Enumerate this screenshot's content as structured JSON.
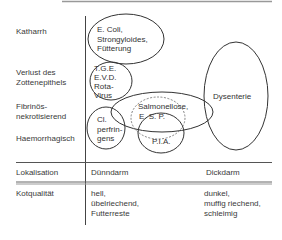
{
  "rows": {
    "katarrh": "Katharrh",
    "verlust_line1": "Verlust des",
    "verlust_line2": "Zottenepithels",
    "fibrin_line1": "Fibrinös-",
    "fibrin_line2": "nekrotisierend",
    "haemorrhagisch": "Haemorrhagisch"
  },
  "diseases": {
    "ecoli": [
      "E. Coli,",
      "Strongyloides,",
      "Fütterung"
    ],
    "tge": [
      "T.G.E.",
      "E.V.D.",
      "Rota-",
      "Virus"
    ],
    "dysenterie": "Dysenterie",
    "salmonellose": [
      "Salmonellose,",
      "E. S. P."
    ],
    "clperfringens": [
      "Cl.",
      "perfrin-",
      "gens"
    ],
    "pia": "P.I.A."
  },
  "table": {
    "lokalisation_label": "Lokalisation",
    "duenndarm": "Dünndarm",
    "dickdarm": "Dickdarm",
    "kotqualitaet_label": "Kotqualität",
    "duenndarm_kot": [
      "hell,",
      "übelriechend,",
      "Futterreste"
    ],
    "dickdarm_kot": [
      "dunkel,",
      "muffig riechend,",
      "schleimig"
    ]
  }
}
